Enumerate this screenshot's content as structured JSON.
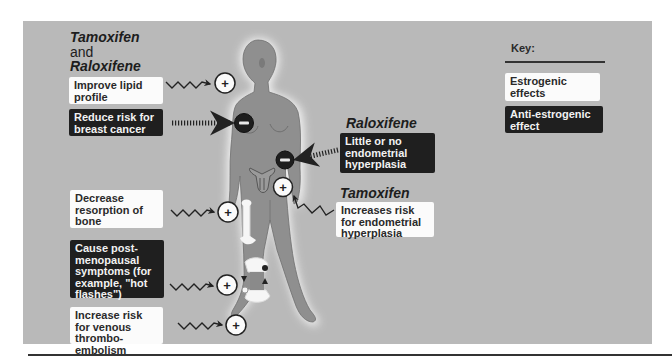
{
  "header": {
    "drug_line1": "Tamoxifen",
    "drug_and": "and",
    "drug_line2": "Raloxifene"
  },
  "left_effects": [
    {
      "text": "Improve lipid profile",
      "type": "estrogenic",
      "marker": "+"
    },
    {
      "text": "Reduce risk for breast cancer",
      "type": "anti-estrogenic",
      "marker": "−"
    },
    {
      "text": "Decrease resorption of bone",
      "type": "estrogenic",
      "marker": "+"
    },
    {
      "text": "Cause post-menopausal symptoms (for example, \"hot flashes\")",
      "type": "anti-estrogenic",
      "marker": "+"
    },
    {
      "text": "Increase risk for venous thrombo-embolism",
      "type": "estrogenic",
      "marker": "+"
    }
  ],
  "right_effects": {
    "raloxifene": {
      "title": "Raloxifene",
      "text": "Little or no endometrial hyperplasia",
      "type": "anti-estrogenic",
      "marker": "−"
    },
    "tamoxifen": {
      "title": "Tamoxifen",
      "text": "Increases risk for endometrial hyperplasia",
      "type": "estrogenic",
      "marker": "+"
    }
  },
  "key": {
    "title": "Key:",
    "estrogenic": "Estrogenic effects",
    "anti_estrogenic": "Anti-estrogenic effect"
  },
  "colors": {
    "panel": "#b9b9b9",
    "body": "#8f8f8f",
    "estrogenic_box": "#fbfbfb",
    "anti_estrogenic_box": "#1f1f1f"
  }
}
